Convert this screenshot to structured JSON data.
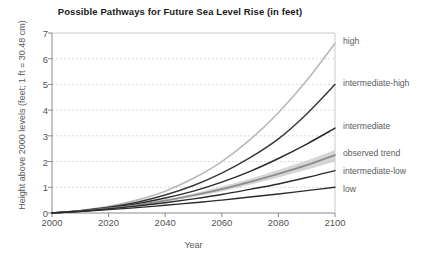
{
  "chart_data": {
    "type": "line",
    "title": "Possible Pathways for Future Sea Level Rise (in feet)",
    "xlabel": "Year",
    "ylabel": "Height above 2000 levels (feet; 1 ft = 30.48 cm)",
    "xlim": [
      2000,
      2100
    ],
    "ylim": [
      0,
      7
    ],
    "xticks": [
      "2000",
      "2020",
      "2040",
      "2060",
      "2080",
      "2100"
    ],
    "xtick_values": [
      2000,
      2020,
      2040,
      2060,
      2080,
      2100
    ],
    "yticks": [
      "0",
      "1",
      "2",
      "3",
      "4",
      "5",
      "6",
      "7"
    ],
    "ytick_values": [
      0,
      1,
      2,
      3,
      4,
      5,
      6,
      7
    ],
    "grid": "horizontal-dashed",
    "legend_position": "right-inline-labels",
    "x": [
      2000,
      2010,
      2020,
      2030,
      2040,
      2050,
      2060,
      2070,
      2080,
      2090,
      2100
    ],
    "series": [
      {
        "name": "high",
        "color": "#b9b9b9",
        "width": 1.6,
        "values": [
          0.0,
          0.1,
          0.25,
          0.5,
          0.85,
          1.35,
          2.0,
          2.85,
          3.9,
          5.15,
          6.6
        ],
        "label": "high",
        "label_y": 6.7
      },
      {
        "name": "intermediate-high",
        "color": "#3a3a3a",
        "width": 1.5,
        "values": [
          0.0,
          0.09,
          0.22,
          0.42,
          0.7,
          1.07,
          1.55,
          2.15,
          2.88,
          3.85,
          5.0
        ],
        "label": "intermediate-high",
        "label_y": 5.05
      },
      {
        "name": "intermediate",
        "color": "#2b2b2b",
        "width": 1.5,
        "values": [
          0.0,
          0.08,
          0.2,
          0.36,
          0.58,
          0.85,
          1.2,
          1.62,
          2.12,
          2.68,
          3.3
        ],
        "label": "intermediate",
        "label_y": 3.4
      },
      {
        "name": "observed trend",
        "color": "#8d8d8d",
        "width": 1.7,
        "band_color": "#c8c8c8",
        "band_low": [
          0.0,
          0.07,
          0.16,
          0.28,
          0.43,
          0.62,
          0.84,
          1.1,
          1.38,
          1.68,
          2.0
        ],
        "band_high": [
          0.0,
          0.09,
          0.2,
          0.35,
          0.53,
          0.76,
          1.03,
          1.33,
          1.67,
          2.04,
          2.45
        ],
        "values": [
          0.0,
          0.08,
          0.18,
          0.31,
          0.48,
          0.69,
          0.93,
          1.21,
          1.52,
          1.86,
          2.25
        ],
        "label": "observed trend",
        "label_y": 2.35
      },
      {
        "name": "intermediate-low",
        "color": "#2b2b2b",
        "width": 1.4,
        "values": [
          0.0,
          0.07,
          0.16,
          0.27,
          0.4,
          0.55,
          0.72,
          0.92,
          1.13,
          1.38,
          1.65
        ],
        "label": "intermediate-low",
        "label_y": 1.63
      },
      {
        "name": "low",
        "color": "#2b2b2b",
        "width": 1.4,
        "values": [
          0.0,
          0.06,
          0.13,
          0.21,
          0.3,
          0.4,
          0.5,
          0.62,
          0.74,
          0.87,
          1.0
        ],
        "label": "low",
        "label_y": 0.95
      }
    ]
  },
  "axis": {
    "title": "Possible Pathways for Future Sea Level Rise (in feet)",
    "xlabel": "Year",
    "ylabel": "Height above 2000 levels (feet; 1 ft = 30.48 cm)"
  },
  "colors": {
    "grid": "#c9c9c9",
    "axis": "#8a8a8a",
    "text": "#555555",
    "title": "#1a1a1a"
  }
}
